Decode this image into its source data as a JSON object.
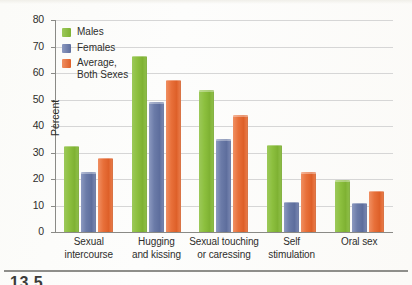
{
  "chart_data": {
    "type": "bar",
    "title": "",
    "xlabel": "",
    "ylabel": "Percent",
    "ylim": [
      0,
      80
    ],
    "yticks": [
      0,
      10,
      20,
      30,
      40,
      50,
      60,
      70,
      80
    ],
    "grid": true,
    "legend_position": "top-left",
    "categories": [
      "Sexual\nintercourse",
      "Hugging\nand kissing",
      "Sexual touching\nor caressing",
      "Self\nstimulation",
      "Oral sex"
    ],
    "series": [
      {
        "name": "Males",
        "color": "#8cc03f",
        "values": [
          32.5,
          66.5,
          53.5,
          33,
          19.5
        ]
      },
      {
        "name": "Females",
        "color": "#6b7ba8",
        "values": [
          22.5,
          49,
          35,
          11.5,
          11
        ]
      },
      {
        "name": "Average,\nBoth Sexes",
        "color": "#e8703a",
        "values": [
          28,
          57.5,
          44,
          22.5,
          15.5
        ]
      }
    ]
  },
  "legend": {
    "items": [
      {
        "label": "Males",
        "color": "#8cc03f"
      },
      {
        "label": "Females",
        "color": "#6b7ba8"
      },
      {
        "label": "Average,\nBoth Sexes",
        "color": "#e8703a"
      }
    ]
  },
  "axis": {
    "y_title": "Percent",
    "y_ticks": [
      "80",
      "70",
      "60",
      "50",
      "40",
      "30",
      "20",
      "10",
      "0"
    ]
  },
  "caption": {
    "figure_number": "13.5"
  }
}
